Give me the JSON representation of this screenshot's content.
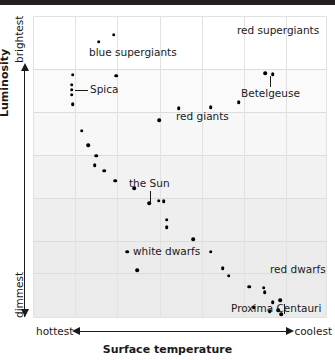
{
  "chart_data": {
    "type": "scatter",
    "title": "",
    "xlabel": "Surface temperature",
    "ylabel": "Luminosity",
    "x_axis_left_label": "hottest",
    "x_axis_right_label": "coolest",
    "y_axis_top_label": "brightest",
    "y_axis_bottom_label": "dimmest",
    "grid": true,
    "x_direction": "reversed (hottest to coolest)",
    "y_direction": "increasing upward (dimmest to brightest)",
    "xlim": [
      0,
      100
    ],
    "ylim": [
      0,
      100
    ],
    "gridlines_x_pct": [
      0,
      14.3,
      28.6,
      43.2,
      57.5,
      71.8,
      86.1,
      100
    ],
    "gridlines_y_pct": [
      0,
      17.5,
      31.8,
      46.0,
      60.3,
      74.5,
      85.1,
      100
    ],
    "annotations": [
      {
        "text": "blue supergiants",
        "x_pct": 28.5,
        "y_pct": 88.0,
        "leader": "none"
      },
      {
        "text": "red supergiants",
        "x_pct": 74.0,
        "y_pct": 95.5,
        "leader": "none"
      },
      {
        "text": "Spica",
        "x_pct": 22.5,
        "y_pct": 76.0,
        "leader": "horizontal-left"
      },
      {
        "text": "Betelgeuse",
        "x_pct": 73.0,
        "y_pct": 72.5,
        "leader": "vertical-up"
      },
      {
        "text": "red giants",
        "x_pct": 54.5,
        "y_pct": 65.0,
        "leader": "none"
      },
      {
        "text": "the Sun",
        "x_pct": 39.5,
        "y_pct": 53.5,
        "leader": "vertical-down"
      },
      {
        "text": "white dwarfs",
        "x_pct": 36.0,
        "y_pct": 21.5,
        "leader": "none"
      },
      {
        "text": "red dwarfs",
        "x_pct": 79.5,
        "y_pct": 16.0,
        "leader": "none"
      },
      {
        "text": "Proxima Centauri",
        "x_pct": 71.5,
        "y_pct": 2.5,
        "leader": "vertical-up"
      }
    ],
    "series": [
      {
        "name": "stars",
        "points": [
          {
            "x_pct": 22.3,
            "y_pct": 91.5,
            "label": ""
          },
          {
            "x_pct": 27.5,
            "y_pct": 93.8,
            "label": ""
          },
          {
            "x_pct": 13.5,
            "y_pct": 80.5,
            "label": ""
          },
          {
            "x_pct": 28.3,
            "y_pct": 80.2,
            "label": ""
          },
          {
            "x_pct": 13.1,
            "y_pct": 77.3,
            "label": "Spica"
          },
          {
            "x_pct": 13.1,
            "y_pct": 75.6,
            "label": "Spica"
          },
          {
            "x_pct": 13.1,
            "y_pct": 74.0,
            "label": "Spica"
          },
          {
            "x_pct": 13.5,
            "y_pct": 70.8,
            "label": ""
          },
          {
            "x_pct": 16.5,
            "y_pct": 62.0,
            "label": ""
          },
          {
            "x_pct": 18.8,
            "y_pct": 57.2,
            "label": ""
          },
          {
            "x_pct": 21.5,
            "y_pct": 53.8,
            "label": ""
          },
          {
            "x_pct": 21.0,
            "y_pct": 50.5,
            "label": ""
          },
          {
            "x_pct": 24.2,
            "y_pct": 48.8,
            "label": ""
          },
          {
            "x_pct": 28.0,
            "y_pct": 45.5,
            "label": ""
          },
          {
            "x_pct": 34.5,
            "y_pct": 43.0,
            "label": ""
          },
          {
            "x_pct": 39.5,
            "y_pct": 38.0,
            "label": "the Sun"
          },
          {
            "x_pct": 42.8,
            "y_pct": 38.8,
            "label": ""
          },
          {
            "x_pct": 44.5,
            "y_pct": 38.6,
            "label": ""
          },
          {
            "x_pct": 45.5,
            "y_pct": 32.5,
            "label": ""
          },
          {
            "x_pct": 45.5,
            "y_pct": 30.0,
            "label": ""
          },
          {
            "x_pct": 54.5,
            "y_pct": 26.0,
            "label": ""
          },
          {
            "x_pct": 60.5,
            "y_pct": 22.0,
            "label": ""
          },
          {
            "x_pct": 64.5,
            "y_pct": 16.5,
            "label": ""
          },
          {
            "x_pct": 66.5,
            "y_pct": 14.0,
            "label": ""
          },
          {
            "x_pct": 32.0,
            "y_pct": 22.0,
            "label": "white dwarfs"
          },
          {
            "x_pct": 35.5,
            "y_pct": 15.8,
            "label": "white dwarfs"
          },
          {
            "x_pct": 73.5,
            "y_pct": 10.3,
            "label": "red dwarfs"
          },
          {
            "x_pct": 78.5,
            "y_pct": 10.0,
            "label": "red dwarfs"
          },
          {
            "x_pct": 78.8,
            "y_pct": 8.5,
            "label": "red dwarfs"
          },
          {
            "x_pct": 81.5,
            "y_pct": 5.2,
            "label": ""
          },
          {
            "x_pct": 84.0,
            "y_pct": 5.8,
            "label": ""
          },
          {
            "x_pct": 75.0,
            "y_pct": 3.5,
            "label": ""
          },
          {
            "x_pct": 80.5,
            "y_pct": 2.3,
            "label": ""
          },
          {
            "x_pct": 83.5,
            "y_pct": 2.5,
            "label": ""
          },
          {
            "x_pct": 84.5,
            "y_pct": 1.2,
            "label": "Proxima Centauri"
          },
          {
            "x_pct": 49.5,
            "y_pct": 69.5,
            "label": "red giants"
          },
          {
            "x_pct": 43.0,
            "y_pct": 65.5,
            "label": "red giants"
          },
          {
            "x_pct": 60.5,
            "y_pct": 69.8,
            "label": "red giants"
          },
          {
            "x_pct": 70.0,
            "y_pct": 71.5,
            "label": "red giants"
          },
          {
            "x_pct": 79.0,
            "y_pct": 81.0,
            "label": "Betelgeuse"
          },
          {
            "x_pct": 81.5,
            "y_pct": 80.8,
            "label": "Betelgeuse"
          }
        ]
      }
    ]
  }
}
